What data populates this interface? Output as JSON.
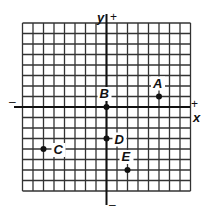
{
  "figure": {
    "type": "coordinate-plane",
    "grid": {
      "columns": 16,
      "rows": 16,
      "origin_col": 8,
      "origin_row": 8
    },
    "axes": {
      "x_label": "x",
      "y_label": "y",
      "x_positive_sign": "+",
      "x_negative_sign": "–",
      "y_positive_sign": "+",
      "y_negative_sign": "–"
    },
    "points": [
      {
        "label": "A",
        "x": 5,
        "y": 1
      },
      {
        "label": "B",
        "x": 0,
        "y": 0
      },
      {
        "label": "C",
        "x": -6,
        "y": -4
      },
      {
        "label": "D",
        "x": 0,
        "y": -3
      },
      {
        "label": "E",
        "x": 2,
        "y": -6
      }
    ],
    "colors": {
      "ink": "#111111",
      "grid": "#333333",
      "background": "#ffffff"
    }
  }
}
